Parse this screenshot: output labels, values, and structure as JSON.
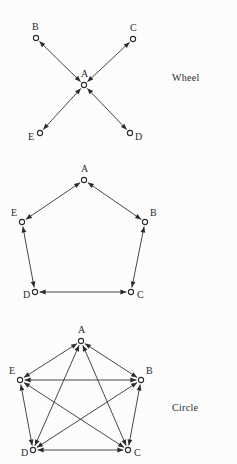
{
  "figure": {
    "background_color": "#fcfcfc",
    "ink_color": "#2b2b2b"
  },
  "diagrams": [
    {
      "id": "wheel",
      "caption": "Wheel",
      "type": "directed-graph",
      "node_count": 5,
      "edge_style": "bidirectional",
      "nodes": [
        {
          "label": "A",
          "x": 84,
          "y": 85,
          "label_x": 81,
          "label_y": 77
        },
        {
          "label": "B",
          "x": 36,
          "y": 38,
          "label_x": 32,
          "label_y": 30
        },
        {
          "label": "C",
          "x": 133,
          "y": 39,
          "label_x": 130,
          "label_y": 31
        },
        {
          "label": "D",
          "x": 130,
          "y": 133,
          "label_x": 135,
          "label_y": 140
        },
        {
          "label": "E",
          "x": 40,
          "y": 133,
          "label_x": 28,
          "label_y": 140
        }
      ],
      "edges": [
        {
          "from": "A",
          "to": "B"
        },
        {
          "from": "A",
          "to": "C"
        },
        {
          "from": "A",
          "to": "D"
        },
        {
          "from": "A",
          "to": "E"
        }
      ]
    },
    {
      "id": "circle",
      "caption": "Circle",
      "type": "directed-graph",
      "node_count": 5,
      "edge_style": "bidirectional",
      "nodes": [
        {
          "label": "A",
          "x": 84,
          "y": 25,
          "label_x": 81,
          "label_y": 17
        },
        {
          "label": "B",
          "x": 145,
          "y": 67,
          "label_x": 150,
          "label_y": 61
        },
        {
          "label": "C",
          "x": 131,
          "y": 137,
          "label_x": 137,
          "label_y": 143
        },
        {
          "label": "D",
          "x": 35,
          "y": 137,
          "label_x": 23,
          "label_y": 143
        },
        {
          "label": "E",
          "x": 22,
          "y": 67,
          "label_x": 11,
          "label_y": 61
        }
      ],
      "edges": [
        {
          "from": "A",
          "to": "B"
        },
        {
          "from": "B",
          "to": "C"
        },
        {
          "from": "C",
          "to": "D"
        },
        {
          "from": "D",
          "to": "E"
        },
        {
          "from": "E",
          "to": "A"
        }
      ]
    },
    {
      "id": "all-channel",
      "caption": "All−channel.",
      "type": "directed-graph",
      "node_count": 5,
      "edge_style": "bidirectional",
      "nodes": [
        {
          "label": "A",
          "x": 81,
          "y": 26,
          "label_x": 78,
          "label_y": 18
        },
        {
          "label": "B",
          "x": 141,
          "y": 65,
          "label_x": 146,
          "label_y": 59
        },
        {
          "label": "C",
          "x": 128,
          "y": 135,
          "label_x": 134,
          "label_y": 141
        },
        {
          "label": "D",
          "x": 33,
          "y": 135,
          "label_x": 21,
          "label_y": 141
        },
        {
          "label": "E",
          "x": 20,
          "y": 65,
          "label_x": 9,
          "label_y": 59
        }
      ],
      "edges": [
        {
          "from": "A",
          "to": "B"
        },
        {
          "from": "A",
          "to": "C"
        },
        {
          "from": "A",
          "to": "D"
        },
        {
          "from": "A",
          "to": "E"
        },
        {
          "from": "B",
          "to": "C"
        },
        {
          "from": "B",
          "to": "D"
        },
        {
          "from": "B",
          "to": "E"
        },
        {
          "from": "C",
          "to": "D"
        },
        {
          "from": "C",
          "to": "E"
        },
        {
          "from": "D",
          "to": "E"
        }
      ]
    }
  ]
}
